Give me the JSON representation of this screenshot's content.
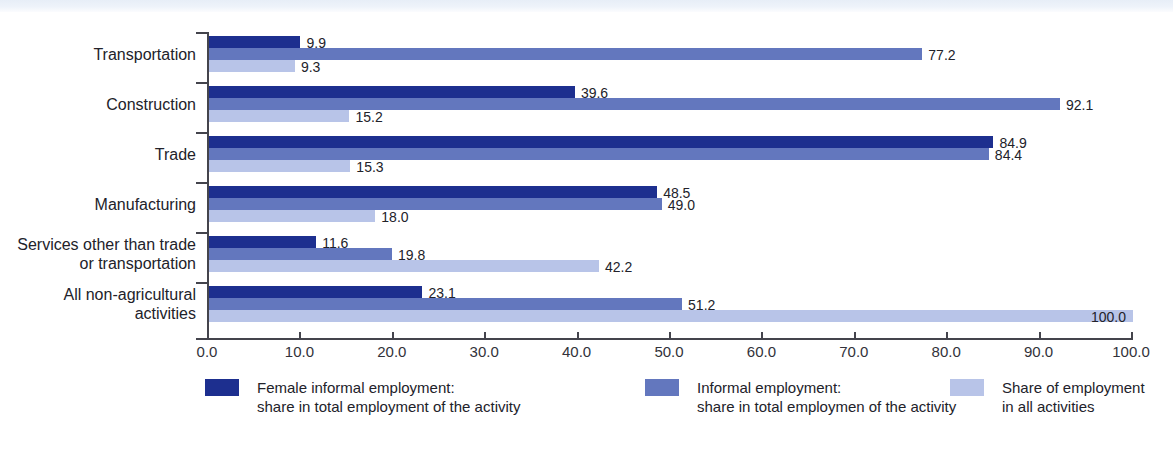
{
  "chart_data": {
    "type": "bar",
    "orientation": "horizontal",
    "title": "",
    "xlabel": "",
    "ylabel": "",
    "xlim": [
      0.0,
      100.0
    ],
    "xticks": [
      "0.0",
      "10.0",
      "20.0",
      "30.0",
      "40.0",
      "50.0",
      "60.0",
      "70.0",
      "80.0",
      "90.0",
      "100.0"
    ],
    "grid": false,
    "legend_position": "bottom",
    "categories": [
      "Transportation",
      "Construction",
      "Trade",
      "Manufacturing",
      "Services other than trade\nor transportation",
      "All non-agricultural\nactivities"
    ],
    "series": [
      {
        "name": "Female informal employment:\nshare in total employment of the activity",
        "color": "#1d2f8f",
        "values": [
          9.9,
          39.6,
          84.9,
          48.5,
          11.6,
          23.1
        ],
        "labels": [
          "9.9",
          "39.6",
          "84.9",
          "48.5",
          "11.6",
          "23.1"
        ]
      },
      {
        "name": "Informal employment:\nshare in total employmen of the activity",
        "color": "#6377be",
        "values": [
          77.2,
          92.1,
          84.4,
          49.0,
          19.8,
          51.2
        ],
        "labels": [
          "77.2",
          "92.1",
          "84.4",
          "49.0",
          "19.8",
          "51.2"
        ]
      },
      {
        "name": "Share of employment\nin all activities",
        "color": "#b8c4e8",
        "values": [
          9.3,
          15.2,
          15.3,
          18.0,
          42.2,
          100.0
        ],
        "labels": [
          "9.3",
          "15.2",
          "15.3",
          "18.0",
          "42.2",
          "100.0"
        ]
      }
    ]
  },
  "legend": {
    "items": [
      {
        "label": "Female informal employment:\nshare in total employment of the activity",
        "color": "#1d2f8f"
      },
      {
        "label": "Informal employment:\nshare in total employmen of the activity",
        "color": "#6377be"
      },
      {
        "label": "Share of employment\nin all activities",
        "color": "#b8c4e8"
      }
    ]
  },
  "colors": {
    "series_dark": "#1d2f8f",
    "series_mid": "#6377be",
    "series_light": "#b8c4e8",
    "axis": "#44444c",
    "text": "#22222a",
    "background": "#ffffff"
  }
}
